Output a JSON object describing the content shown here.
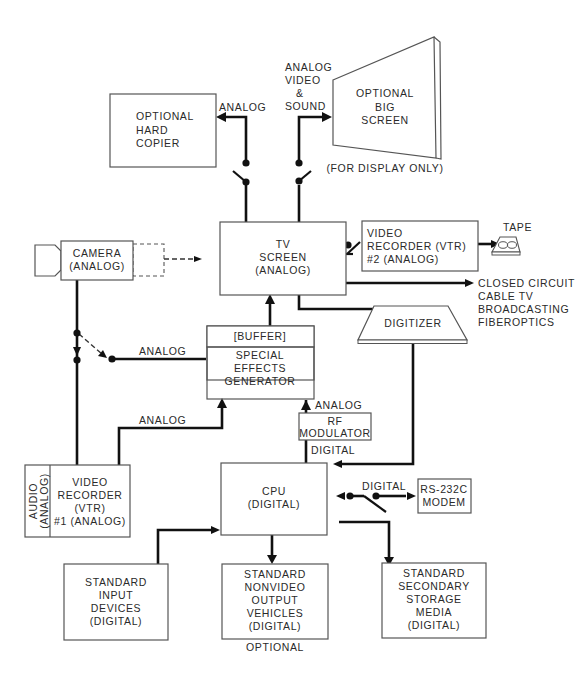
{
  "diagram": {
    "blocks": {
      "hard_copier": {
        "lines": [
          "OPTIONAL",
          "HARD",
          "COPIER"
        ]
      },
      "big_screen": {
        "lines": [
          "OPTIONAL",
          "BIG",
          "SCREEN"
        ],
        "caption": "(FOR DISPLAY ONLY)"
      },
      "tv_screen": {
        "lines": [
          "TV",
          "SCREEN",
          "(ANALOG)"
        ]
      },
      "camera": {
        "lines": [
          "CAMERA",
          "(ANALOG)"
        ]
      },
      "vtr2": {
        "lines": [
          "VIDEO",
          "RECORDER (VTR)",
          "#2 (ANALOG)"
        ]
      },
      "tape": {
        "label": "TAPE"
      },
      "digitizer": {
        "label": "DIGITIZER"
      },
      "seg": {
        "buffer": "[BUFFER]",
        "lines": [
          "SPECIAL",
          "EFFECTS",
          "GENERATOR"
        ]
      },
      "rf_modulator": {
        "lines": [
          "RF",
          "MODULATOR"
        ]
      },
      "vtr1": {
        "lines": [
          "VIDEO",
          "RECORDER",
          "(VTR)",
          "#1 (ANALOG)"
        ],
        "side_lines": [
          "AUDIO",
          "(ANALOG)"
        ]
      },
      "cpu": {
        "lines": [
          "CPU",
          "(DIGITAL)"
        ]
      },
      "modem": {
        "lines": [
          "RS-232C",
          "MODEM"
        ]
      },
      "input_devices": {
        "lines": [
          "STANDARD",
          "INPUT",
          "DEVICES",
          "(DIGITAL)"
        ]
      },
      "output_vehicles": {
        "lines": [
          "STANDARD",
          "NONVIDEO",
          "OUTPUT",
          "VEHICLES",
          "(DIGITAL)"
        ],
        "caption": "OPTIONAL"
      },
      "storage": {
        "lines": [
          "STANDARD",
          "SECONDARY",
          "STORAGE",
          "MEDIA",
          "(DIGITAL)"
        ]
      }
    },
    "labels": {
      "to_copier": "ANALOG",
      "to_big_screen": [
        "ANALOG",
        "VIDEO",
        "&",
        "SOUND"
      ],
      "broadcast": [
        "CLOSED CIRCUIT",
        "CABLE TV",
        "BROADCASTING",
        "FIBEROPTICS"
      ],
      "camera_to_seg": "ANALOG",
      "vtr1_to_seg": "ANALOG",
      "rf_out": "ANALOG",
      "rf_in": "DIGITAL",
      "cpu_to_modem": "DIGITAL"
    }
  }
}
